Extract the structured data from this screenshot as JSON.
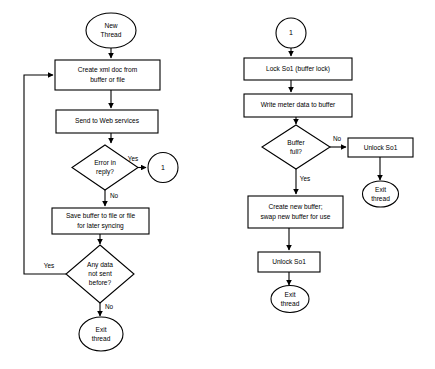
{
  "diagram": {
    "background_color": "#ffffff",
    "stroke_color": "#000000",
    "fill_color": "#ffffff"
  },
  "left_flow": {
    "start": {
      "line1": "New",
      "line2": "Thread"
    },
    "create_xml": {
      "line1": "Create xml doc from",
      "line2": "buffer or file"
    },
    "send_web": {
      "line1": "Send to Web services"
    },
    "error_decision": {
      "line1": "Error in",
      "line2": "reply?"
    },
    "error_yes_label": "Yes",
    "error_no_label": "No",
    "connector_1": "1",
    "save_buffer": {
      "line1": "Save buffer to file or file",
      "line2": "for later syncing"
    },
    "anydata_decision": {
      "line1": "Any data",
      "line2": "not sent",
      "line3": "before?"
    },
    "anydata_yes_label": "Yes",
    "anydata_no_label": "No",
    "exit": {
      "line1": "Exit",
      "line2": "thread"
    }
  },
  "right_flow": {
    "start_connector": "1",
    "lock": {
      "line1": "Lock So1 (buffer lock)"
    },
    "write_meter": {
      "line1": "Write meter data to buffer"
    },
    "buffer_decision": {
      "line1": "Buffer",
      "line2": "full?"
    },
    "buffer_no_label": "No",
    "buffer_yes_label": "Yes",
    "unlock_no_branch": {
      "line1": "Unlock  So1"
    },
    "exit_no_branch": {
      "line1": "Exit",
      "line2": "thread"
    },
    "create_buffer": {
      "line1": "Create new  buffer;",
      "line2": "swap new buffer for use"
    },
    "unlock_yes_branch": {
      "line1": "Unlock So1"
    },
    "exit_yes_branch": {
      "line1": "Exit",
      "line2": "thread"
    }
  }
}
